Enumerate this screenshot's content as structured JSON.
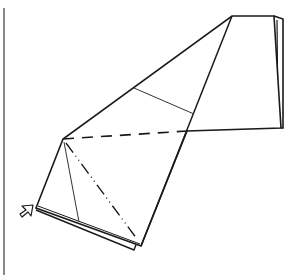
{
  "diagram": {
    "type": "origami-fold-step",
    "colors": {
      "background": "#ffffff",
      "outline": "#1a1a1a",
      "guide": "#333333",
      "margin_rule": "#888888"
    },
    "margin_rule": {
      "x": 4,
      "y1": 8,
      "y2": 275
    },
    "paper": {
      "front_outline": [
        [
          232,
          16
        ],
        [
          274,
          16
        ],
        [
          281,
          128
        ],
        [
          187,
          131
        ],
        [
          141,
          246
        ],
        [
          36,
          208
        ],
        [
          63,
          139
        ]
      ],
      "back_layer_top": [
        [
          274,
          16
        ],
        [
          283,
          19
        ],
        [
          283,
          128
        ]
      ],
      "back_layer_bottom": [
        [
          36,
          210
        ],
        [
          134,
          250
        ],
        [
          137,
          242
        ]
      ],
      "inner_edge_right": [
        [
          277,
          20
        ],
        [
          278,
          126
        ]
      ],
      "crease_diagonal": [
        [
          232,
          16
        ],
        [
          141,
          246
        ]
      ]
    },
    "fold_lines": [
      {
        "kind": "existing-crease",
        "points": [
          [
            134,
            88
          ],
          [
            194,
            114
          ]
        ]
      },
      {
        "kind": "existing-crease",
        "points": [
          [
            64,
            142
          ],
          [
            79,
            222
          ]
        ]
      },
      {
        "kind": "mountain-fold-dashed",
        "points": [
          [
            63,
            139
          ],
          [
            187,
            131
          ]
        ]
      },
      {
        "kind": "valley-fold-dash-dot",
        "points": [
          [
            66,
            143
          ],
          [
            137,
            239
          ]
        ]
      }
    ],
    "indicator": {
      "kind": "push-arrow",
      "position": [
        26,
        212
      ],
      "direction": "up-right"
    }
  }
}
